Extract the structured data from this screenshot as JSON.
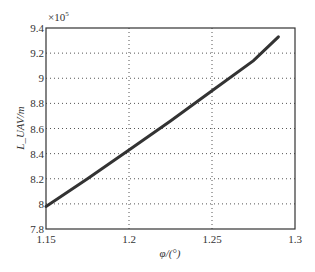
{
  "chart_data": {
    "type": "line",
    "title": "",
    "xlabel": "φ/(°)",
    "ylabel": "L_UAV/m",
    "y_multiplier": "×10",
    "y_multiplier_exp": "5",
    "xlim": [
      1.15,
      1.3
    ],
    "ylim": [
      7.8,
      9.4
    ],
    "xticks": [
      "1.15",
      "1.2",
      "1.25",
      "1.3"
    ],
    "yticks": [
      "7.8",
      "8",
      "8.2",
      "8.4",
      "8.6",
      "8.8",
      "9",
      "9.2",
      "9.4"
    ],
    "grid": true,
    "legend": null,
    "series": [
      {
        "name": "L_UAV",
        "color": "#333333",
        "x": [
          1.15,
          1.175,
          1.2,
          1.225,
          1.25,
          1.275,
          1.29
        ],
        "y": [
          7.98,
          8.2,
          8.43,
          8.66,
          8.9,
          9.14,
          9.33
        ]
      }
    ]
  }
}
